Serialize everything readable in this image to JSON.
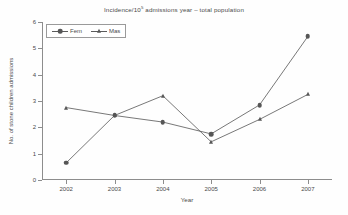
{
  "chart_data": {
    "type": "line",
    "title_prefix": "Incidence/10",
    "title_sup": "5",
    "title_suffix": " admissions year – total population",
    "xlabel": "Year",
    "ylabel": "No. of stone children admissions",
    "categories": [
      "2002",
      "2003",
      "2004",
      "2005",
      "2006",
      "2007"
    ],
    "ylim": [
      0,
      6
    ],
    "ytick_labels": [
      "0",
      "1",
      "2",
      "3",
      "4",
      "5",
      "6"
    ],
    "yticks": [
      0,
      1,
      2,
      3,
      4,
      5,
      6
    ],
    "grid": false,
    "legend_position": "top-left-inside",
    "series": [
      {
        "name": "Fem",
        "marker": "circle",
        "color": "#565656",
        "values": [
          0.65,
          2.45,
          2.2,
          1.75,
          2.85,
          5.45
        ]
      },
      {
        "name": "Mas",
        "marker": "triangle",
        "color": "#565656",
        "values": [
          2.75,
          2.45,
          3.2,
          1.45,
          2.3,
          3.25
        ]
      }
    ]
  },
  "legend": {
    "entries": [
      {
        "label": "Fem"
      },
      {
        "label": "Mas"
      }
    ]
  },
  "colors": {
    "axis": "#8d8d8d",
    "series": "#565656",
    "text": "#4a4a4a",
    "background": "#fefefe"
  }
}
